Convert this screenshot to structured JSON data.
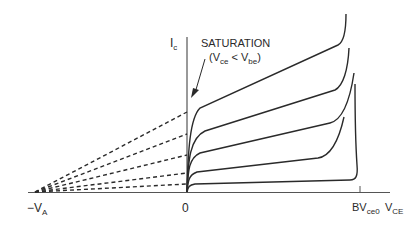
{
  "diagram": {
    "type": "BJT output characteristics (Ic vs VCE) with Early voltage extrapolation",
    "y_axis": {
      "label_main": "I",
      "label_sub": "c"
    },
    "x_axis": {
      "origin_label": "0",
      "early_label_main": "−V",
      "early_label_sub": "A",
      "breakdown_label_main": "BV",
      "breakdown_label_sub": "ce0",
      "vce_label_main": "V",
      "vce_label_sub": "CE"
    },
    "annotation": {
      "title": "SATURATION",
      "cond_open": "(V",
      "cond_sub1": "ce",
      "cond_mid": " < V",
      "cond_sub2": "be",
      "cond_close": ")"
    },
    "curves": [
      {
        "name": "Ib5",
        "y_at_axis": 112
      },
      {
        "name": "Ib4",
        "y_at_axis": 134
      },
      {
        "name": "Ib3",
        "y_at_axis": 155
      },
      {
        "name": "Ib2",
        "y_at_axis": 173
      },
      {
        "name": "Ib1",
        "y_at_axis": 184
      }
    ],
    "colors": {
      "line": "#2a2a2a",
      "axis": "#555555"
    }
  }
}
